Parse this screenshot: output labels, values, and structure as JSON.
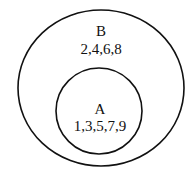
{
  "diagram": {
    "type": "venn",
    "sets": [
      {
        "label": "B",
        "elements": "2,4,6,8",
        "role": "outer"
      },
      {
        "label": "A",
        "elements": "1,3,5,7,9",
        "role": "inner"
      }
    ]
  }
}
